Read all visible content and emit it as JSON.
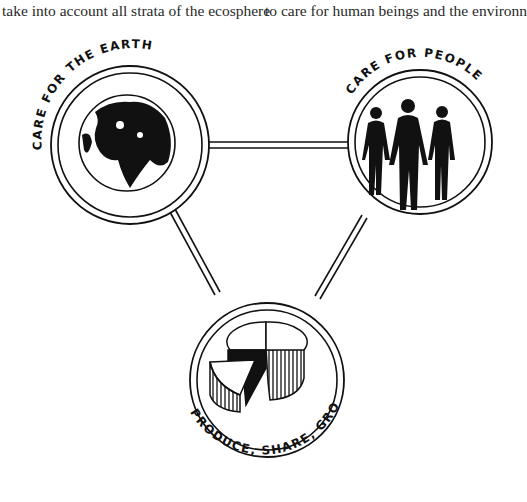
{
  "text_lines": [
    "take into account all strata of the ecosphere",
    "to care for human beings and the environn"
  ],
  "diagram": {
    "nodes": [
      {
        "id": "earth",
        "label": "CARE FOR THE EARTH",
        "icon": "globe-icon"
      },
      {
        "id": "people",
        "label": "CARE FOR PEOPLE",
        "icon": "people-icon"
      },
      {
        "id": "share",
        "label": "PRODUCE, SHARE, GROW",
        "icon": "pie-chart-icon"
      }
    ],
    "edges": [
      [
        "earth",
        "people"
      ],
      [
        "earth",
        "share"
      ],
      [
        "people",
        "share"
      ]
    ]
  }
}
